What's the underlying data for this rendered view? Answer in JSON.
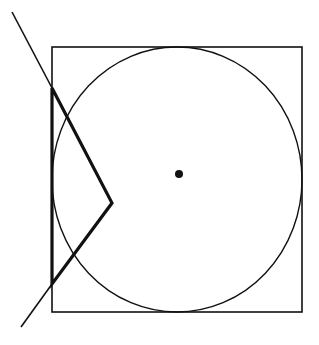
{
  "diagram": {
    "background": "#ffffff",
    "stroke_color": "#111111",
    "square": {
      "x": 52,
      "y": 47,
      "width": 250,
      "height": 265,
      "stroke_width": 1.6
    },
    "circle": {
      "cx": 177,
      "cy": 179.5,
      "rx": 125,
      "ry": 132.5,
      "stroke_width": 1.4
    },
    "center_dot": {
      "cx": 179,
      "cy": 174,
      "r": 4
    },
    "bold_polyline": {
      "points": "52,88 112,203 52,284 52,88",
      "stroke_width": 3.2
    },
    "thin_line_upper": {
      "x1": 12,
      "y1": 12,
      "x2": 52,
      "y2": 88,
      "stroke_width": 1.6
    },
    "thin_line_lower": {
      "x1": 52,
      "y1": 284,
      "x2": 21,
      "y2": 327,
      "stroke_width": 1.6
    }
  }
}
